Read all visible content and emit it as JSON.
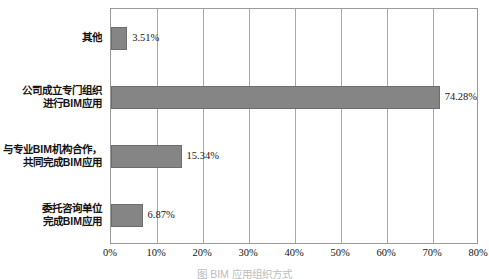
{
  "chart_data": {
    "type": "bar",
    "orientation": "horizontal",
    "title": "",
    "xlabel": "",
    "ylabel": "",
    "xlim": [
      0,
      80
    ],
    "xtick_labels": [
      "0%",
      "10%",
      "20%",
      "30%",
      "40%",
      "50%",
      "60%",
      "70%",
      "80%"
    ],
    "xtick_values": [
      0,
      10,
      20,
      30,
      40,
      50,
      60,
      70,
      80
    ],
    "grid": "vertical",
    "legend": "none",
    "bar_color": "#858585",
    "categories": [
      "其他",
      "公司成立专门组织\n进行BIM应用",
      "与专业BIM机构合作，\n共同完成BIM应用",
      "委托咨询单位\n完成BIM应用"
    ],
    "category_lines": [
      [
        "其他"
      ],
      [
        "公司成立专门组织",
        "进行BIM应用"
      ],
      [
        "与专业BIM机构合作，",
        "共同完成BIM应用"
      ],
      [
        "委托咨询单位",
        "完成BIM应用"
      ]
    ],
    "values": [
      3.51,
      74.28,
      15.34,
      6.87
    ],
    "value_labels": [
      "3.51%",
      "74.28%",
      "15.34%",
      "6.87%"
    ]
  },
  "caption": {
    "text": "图 BIM 应用组织方式"
  }
}
